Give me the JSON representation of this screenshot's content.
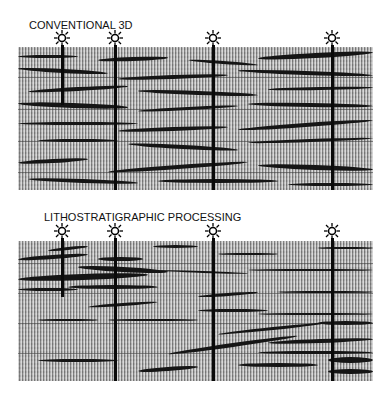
{
  "panels": [
    {
      "title": "CONVENTIONAL 3D",
      "wells": [
        {
          "x": 62,
          "depth_end": 105
        },
        {
          "x": 115,
          "depth_end": 190
        },
        {
          "x": 213,
          "depth_end": 190
        },
        {
          "x": 332,
          "depth_end": 190
        }
      ],
      "well_icon": "sun-well-symbol-icon"
    },
    {
      "title": "LITHOSTRATIGRAPHIC PROCESSING",
      "wells": [
        {
          "x": 62,
          "depth_end": 297
        },
        {
          "x": 115,
          "depth_end": 381
        },
        {
          "x": 213,
          "depth_end": 381
        },
        {
          "x": 332,
          "depth_end": 381
        }
      ],
      "well_icon": "sun-well-symbol-icon"
    }
  ],
  "colors": {
    "reflector": "#151515",
    "background": "#a9a9a9",
    "well": "#0a0a0a"
  }
}
